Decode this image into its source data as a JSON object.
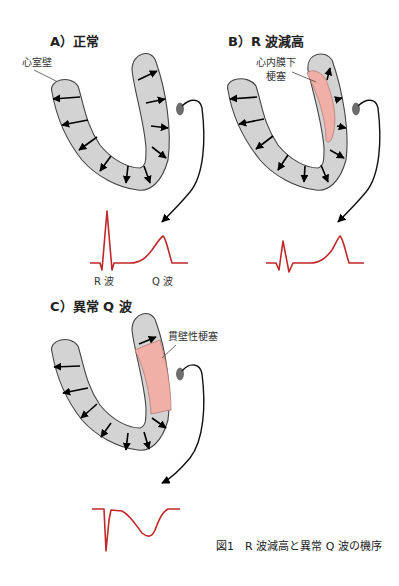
{
  "panels": {
    "a": {
      "title": "A）正常",
      "wall_label": "心室壁",
      "ecg_labels": {
        "r": "R 波",
        "q": "Q 波"
      }
    },
    "b": {
      "title": "B）R 波減高",
      "infarct_label_line1": "心内膜下",
      "infarct_label_line2": "梗塞"
    },
    "c": {
      "title": "C）異常 Q 波",
      "infarct_label": "貫壁性梗塞"
    }
  },
  "caption": "図1　R 波減高と異常 Q 波の機序",
  "colors": {
    "wall": "#d3d3d3",
    "infarct": "#f0b0a8",
    "ecg": "#c0282a",
    "electrode": "#6e6e6e"
  }
}
